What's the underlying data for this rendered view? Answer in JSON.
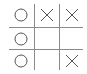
{
  "game": {
    "name": "tic-tac-toe",
    "board": [
      [
        "O",
        "X",
        "X"
      ],
      [
        "O",
        "",
        ""
      ],
      [
        "O",
        "",
        "X"
      ]
    ],
    "colors": {
      "grid": "#8a8a8a",
      "mark": "#555555",
      "background": "#ffffff"
    }
  }
}
